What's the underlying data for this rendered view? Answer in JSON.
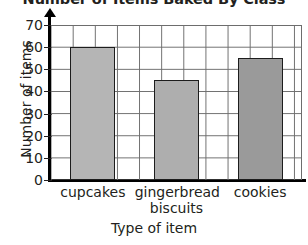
{
  "chart_data": {
    "type": "bar",
    "title": "Number of Items Baked By Class",
    "xlabel": "Type of item",
    "ylabel": "Number of items",
    "categories": [
      "cupcakes",
      "gingerbread biscuits",
      "cookies"
    ],
    "category_lines": [
      [
        "cupcakes"
      ],
      [
        "gingerbread",
        "biscuits"
      ],
      [
        "cookies"
      ]
    ],
    "values": [
      60,
      45,
      55
    ],
    "ylim": [
      0,
      70
    ],
    "ytick_labels": [
      "0",
      "10",
      "20",
      "30",
      "40",
      "50",
      "60",
      "70"
    ],
    "ytick_values": [
      0,
      10,
      20,
      30,
      40,
      50,
      60,
      70
    ],
    "ystep": 10,
    "grid": true,
    "legend": "none",
    "bar_colors": [
      "#b5b5b5",
      "#aeaeae",
      "#9a9a9a"
    ],
    "bar_edge_color": "#1d1d1d",
    "grid_color": "#6d6d6d",
    "axis_color": "#000000",
    "background": "#ffffff"
  }
}
